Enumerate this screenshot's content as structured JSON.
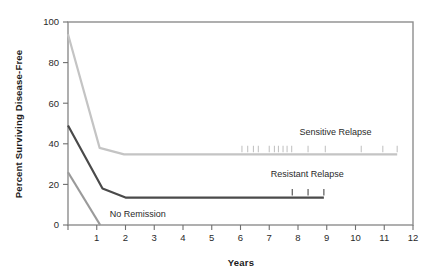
{
  "chart_data": {
    "type": "line",
    "title": "",
    "xlabel": "Years",
    "ylabel": "Percent Surviving Disease-Free",
    "xlim": [
      0,
      12
    ],
    "ylim": [
      0,
      100
    ],
    "xticks": [
      0,
      1,
      2,
      3,
      4,
      5,
      6,
      7,
      8,
      9,
      10,
      11,
      12
    ],
    "xticklabels": [
      "",
      "1",
      "2",
      "3",
      "4",
      "5",
      "6",
      "7",
      "8",
      "9",
      "10",
      "11",
      "12"
    ],
    "yticks": [
      0,
      20,
      40,
      60,
      80,
      100
    ],
    "yticklabels": [
      "0",
      "20",
      "40",
      "60",
      "80",
      "100"
    ],
    "grid": false,
    "legend_position": "inline-annotations",
    "series": [
      {
        "name": "Sensitive Relapse",
        "color": "#c4c4c4",
        "label_x": 8.05,
        "label_y": 44.5,
        "points": [
          {
            "x": 0.0,
            "y": 94
          },
          {
            "x": 1.1,
            "y": 38
          },
          {
            "x": 1.95,
            "y": 34.8
          },
          {
            "x": 11.45,
            "y": 34.8
          }
        ],
        "censor_marks": [
          6.05,
          6.25,
          6.45,
          6.62,
          7.0,
          7.18,
          7.32,
          7.48,
          7.62,
          7.78,
          8.35,
          8.95,
          10.2,
          10.95,
          11.45
        ]
      },
      {
        "name": "Resistant Relapse",
        "color": "#4a4a4a",
        "label_x": 7.05,
        "label_y": 23.5,
        "points": [
          {
            "x": 0.0,
            "y": 49
          },
          {
            "x": 1.2,
            "y": 18
          },
          {
            "x": 2.0,
            "y": 13.5
          },
          {
            "x": 8.9,
            "y": 13.5
          }
        ],
        "censor_marks": [
          7.8,
          8.35,
          8.9
        ]
      },
      {
        "name": "No Remission",
        "color": "#9a9a9a",
        "label_x": 1.45,
        "label_y": 4.0,
        "points": [
          {
            "x": 0.0,
            "y": 26
          },
          {
            "x": 1.12,
            "y": 0
          }
        ],
        "censor_marks": []
      }
    ]
  },
  "annotations": {
    "sensitive_relapse": "Sensitive Relapse",
    "resistant_relapse": "Resistant Relapse",
    "no_remission": "No Remission"
  },
  "axes": {
    "y_title": "Percent Surviving Disease-Free",
    "x_title": "Years"
  }
}
